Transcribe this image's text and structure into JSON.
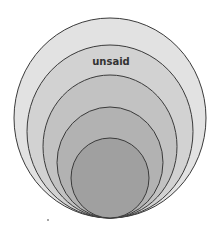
{
  "diagram": {
    "type": "nested-circles",
    "canvas": {
      "width": 224,
      "height": 236,
      "background": "#ffffff"
    },
    "stroke_color": "#3a3a3a",
    "stroke_width": 1,
    "circles": [
      {
        "id": "circle-1",
        "cx": 110,
        "cy": 118,
        "rx": 96,
        "ry": 100,
        "fill": "#e2e2e2"
      },
      {
        "id": "circle-2",
        "cx": 110,
        "cy": 131.5,
        "rx": 83,
        "ry": 86.5,
        "fill": "#d2d2d2"
      },
      {
        "id": "circle-3",
        "cx": 110,
        "cy": 146.5,
        "rx": 67,
        "ry": 71.5,
        "fill": "#c2c2c2"
      },
      {
        "id": "circle-4",
        "cx": 110,
        "cy": 162.5,
        "rx": 53,
        "ry": 55.5,
        "fill": "#b2b2b2"
      },
      {
        "id": "circle-5",
        "cx": 110,
        "cy": 178,
        "rx": 39,
        "ry": 40,
        "fill": "#a0a0a0"
      }
    ],
    "labels": [
      {
        "text": "unsaid",
        "x": 111,
        "y": 65,
        "ring": "circle-2"
      }
    ]
  }
}
